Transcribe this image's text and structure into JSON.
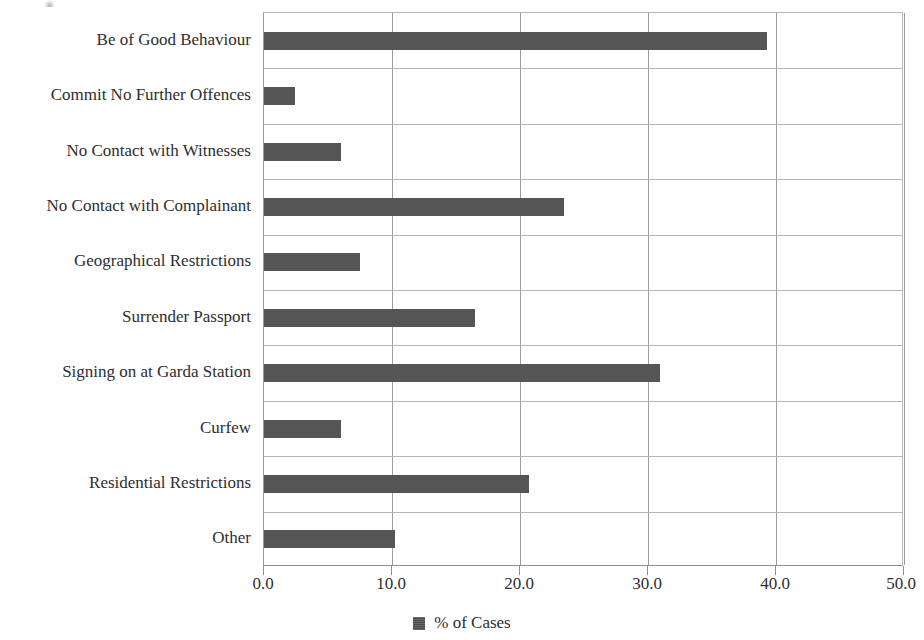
{
  "chart_data": {
    "type": "bar",
    "orientation": "horizontal",
    "title": "",
    "xlabel": "",
    "ylabel": "",
    "xlim": [
      0.0,
      50.0
    ],
    "xticks": [
      "0.0",
      "10.0",
      "20.0",
      "30.0",
      "40.0",
      "50.0"
    ],
    "xtick_values": [
      0,
      10,
      20,
      30,
      40,
      50
    ],
    "grid": "vertical and horizontal gridlines",
    "legend": {
      "position": "bottom-center",
      "entries": [
        {
          "label": "% of Cases",
          "color": "#555555",
          "marker": "square"
        }
      ]
    },
    "categories": [
      "Be of Good Behaviour",
      "Commit No Further Offences",
      "No Contact with Witnesses",
      "No Contact with Complainant",
      "Geographical Restrictions",
      "Surrender Passport",
      "Signing on at Garda Station",
      "Curfew",
      "Residential Restrictions",
      "Other"
    ],
    "values": [
      39.3,
      2.4,
      6.0,
      23.4,
      7.5,
      16.5,
      30.9,
      6.0,
      20.7,
      10.2
    ],
    "series": [
      {
        "name": "% of Cases",
        "values": [
          39.3,
          2.4,
          6.0,
          23.4,
          7.5,
          16.5,
          30.9,
          6.0,
          20.7,
          10.2
        ]
      }
    ]
  },
  "axis": {
    "x_tick_labels": [
      "0.0",
      "10.0",
      "20.0",
      "30.0",
      "40.0",
      "50.0"
    ]
  },
  "legend": {
    "label": "% of Cases"
  },
  "colors": {
    "bar": "#555555",
    "gridline": "#9e9e9e",
    "axis": "#8f8f8f",
    "text": "#2e2e2e",
    "background": "#ffffff"
  }
}
